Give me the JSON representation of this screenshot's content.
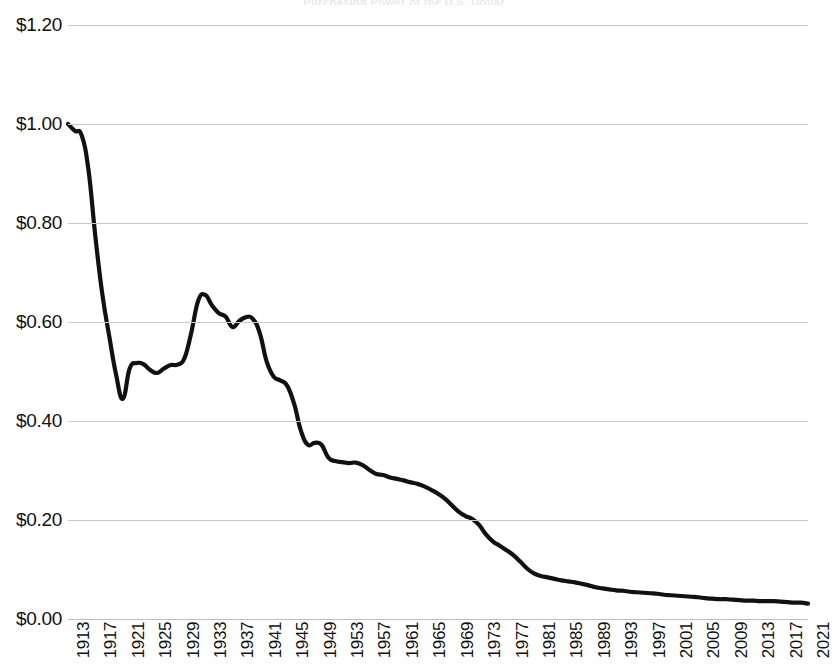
{
  "chart": {
    "title": "Purchasing Power of the U.S. Dollar",
    "currency_prefix": "$"
  },
  "chart_data": {
    "type": "line",
    "title": "Purchasing Power of the U.S. Dollar",
    "subtitle": "",
    "xlabel": "",
    "ylabel": "",
    "grid": true,
    "legend": "none",
    "line_color": "#111111",
    "grid_color": "#c9c9cf",
    "background": "#ffffff",
    "xlim": [
      1913,
      2021
    ],
    "ylim": [
      0.0,
      1.2
    ],
    "ytick_labels": [
      "$0.00",
      "$0.20",
      "$0.40",
      "$0.60",
      "$0.80",
      "$1.00",
      "$1.20"
    ],
    "ytick_values": [
      0.0,
      0.2,
      0.4,
      0.6,
      0.8,
      1.0,
      1.2
    ],
    "xtick_labels": [
      "1913",
      "1917",
      "1921",
      "1925",
      "1929",
      "1933",
      "1937",
      "1941",
      "1945",
      "1949",
      "1953",
      "1957",
      "1961",
      "1965",
      "1969",
      "1973",
      "1977",
      "1981",
      "1985",
      "1989",
      "1993",
      "1997",
      "2001",
      "2005",
      "2009",
      "2013",
      "2017",
      "2021"
    ],
    "xtick_step": 4,
    "x": [
      1913,
      1914,
      1915,
      1916,
      1917,
      1918,
      1919,
      1920,
      1921,
      1922,
      1923,
      1924,
      1925,
      1926,
      1927,
      1928,
      1929,
      1930,
      1931,
      1932,
      1933,
      1934,
      1935,
      1936,
      1937,
      1938,
      1939,
      1940,
      1941,
      1942,
      1943,
      1944,
      1945,
      1946,
      1947,
      1948,
      1949,
      1950,
      1951,
      1952,
      1953,
      1954,
      1955,
      1956,
      1957,
      1958,
      1959,
      1960,
      1961,
      1962,
      1963,
      1964,
      1965,
      1966,
      1967,
      1968,
      1969,
      1970,
      1971,
      1972,
      1973,
      1974,
      1975,
      1976,
      1977,
      1978,
      1979,
      1980,
      1981,
      1982,
      1983,
      1984,
      1985,
      1986,
      1987,
      1988,
      1989,
      1990,
      1991,
      1992,
      1993,
      1994,
      1995,
      1996,
      1997,
      1998,
      1999,
      2000,
      2001,
      2002,
      2003,
      2004,
      2005,
      2006,
      2007,
      2008,
      2009,
      2010,
      2011,
      2012,
      2013,
      2014,
      2015,
      2016,
      2017,
      2018,
      2019,
      2020,
      2021
    ],
    "values": [
      1.0,
      0.986,
      0.977,
      0.906,
      0.772,
      0.657,
      0.573,
      0.495,
      0.445,
      0.506,
      0.517,
      0.515,
      0.503,
      0.497,
      0.506,
      0.513,
      0.514,
      0.527,
      0.579,
      0.643,
      0.655,
      0.634,
      0.618,
      0.611,
      0.59,
      0.602,
      0.61,
      0.606,
      0.577,
      0.52,
      0.49,
      0.482,
      0.471,
      0.435,
      0.38,
      0.352,
      0.356,
      0.352,
      0.326,
      0.319,
      0.317,
      0.315,
      0.316,
      0.311,
      0.301,
      0.293,
      0.291,
      0.286,
      0.283,
      0.28,
      0.276,
      0.273,
      0.268,
      0.261,
      0.253,
      0.243,
      0.23,
      0.217,
      0.208,
      0.202,
      0.19,
      0.171,
      0.157,
      0.148,
      0.139,
      0.129,
      0.116,
      0.102,
      0.092,
      0.087,
      0.084,
      0.081,
      0.078,
      0.076,
      0.074,
      0.071,
      0.068,
      0.064,
      0.062,
      0.06,
      0.058,
      0.057,
      0.055,
      0.054,
      0.053,
      0.052,
      0.051,
      0.049,
      0.048,
      0.047,
      0.046,
      0.045,
      0.044,
      0.042,
      0.041,
      0.04,
      0.04,
      0.039,
      0.038,
      0.037,
      0.037,
      0.036,
      0.036,
      0.036,
      0.035,
      0.034,
      0.033,
      0.033,
      0.031
    ],
    "annotations": []
  }
}
